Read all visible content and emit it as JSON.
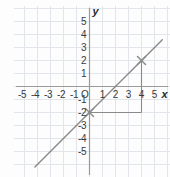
{
  "chart_data": {
    "type": "line",
    "title": "",
    "xlabel": "x",
    "ylabel": "y",
    "xlim": [
      -6.6,
      6.1
    ],
    "ylim": [
      -6.2,
      6.3
    ],
    "grid": true,
    "grid_step": 1,
    "legend": "none",
    "axis_origin_label": "O",
    "x_tick_labels": [
      "-5",
      "-4",
      "-3",
      "-2",
      "-1",
      "1",
      "2",
      "3",
      "4",
      "5"
    ],
    "x_tick_values": [
      -5,
      -4,
      -3,
      -2,
      -1,
      1,
      2,
      3,
      4,
      5
    ],
    "y_tick_labels": [
      "5",
      "4",
      "3",
      "2",
      "1",
      "-1",
      "-2",
      "-3",
      "-4",
      "-5"
    ],
    "y_tick_values": [
      5,
      4,
      3,
      2,
      1,
      -1,
      -2,
      -3,
      -4,
      -5
    ],
    "series": [
      {
        "name": "line",
        "equation": "y = x - 2",
        "slope": 1,
        "intercept": -2,
        "x": [
          -4.2,
          5.6
        ],
        "values": [
          -6.2,
          3.6
        ],
        "color": "#8a8a8a"
      }
    ],
    "markers": [
      {
        "label": "y-intercept",
        "x": 0,
        "y": -2,
        "style": "x-cross",
        "color": "#8a8a8a"
      },
      {
        "label": "second-point",
        "x": 4,
        "y": 2,
        "style": "x-cross",
        "color": "#8a8a8a"
      }
    ],
    "annotations": [
      {
        "name": "slope-triangle",
        "type": "rise-run",
        "run": 4,
        "rise": 4,
        "from": [
          0,
          -2
        ],
        "to": [
          4,
          2
        ],
        "color": "#8a8a8a"
      }
    ],
    "colors": {
      "background": "#fdfdfd",
      "grid": "#e2e6ea",
      "axis": "#9a9a9a",
      "line": "#8a8a8a",
      "text": "#3a3a3a"
    }
  },
  "axis_labels": {
    "x": "x",
    "y": "y",
    "origin": "O"
  }
}
